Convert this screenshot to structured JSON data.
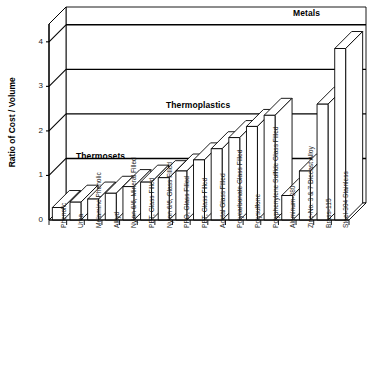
{
  "chart_data": {
    "type": "bar",
    "title": "",
    "xlabel": "",
    "ylabel": "Ratio of Cost / Volume",
    "ylim": [
      0,
      4.4
    ],
    "yticks": [
      0,
      1,
      2,
      3,
      4
    ],
    "ytick_labels": [
      "0",
      "1",
      "2",
      "3",
      "4"
    ],
    "grid": false,
    "style": "3d-bar",
    "legend_position": "none",
    "group_labels": [
      {
        "name": "thermosets",
        "text": "Thermosets"
      },
      {
        "name": "thermoplastics",
        "text": "Thermoplastics"
      },
      {
        "name": "metals",
        "text": "Metals"
      }
    ],
    "categories": [
      "Phenolic",
      "Urea",
      "Melamine Phenolic",
      "Alkyd",
      "Nylon 6/6, Mineral Filled",
      "PET, Glass Filled",
      "Nylon 6/6, Glass Filled",
      "PPO, Glass Filled",
      "PBT, Glass Filled",
      "Acetal Glass Filled",
      "Polycarbonate Glass Filled",
      "Polysulfone",
      "Polyphenylene Sulfide Glass Filled",
      "Aluminum-380",
      "Zinc-No. 3 & 7 Diecast Alloy",
      "Brass-115",
      "Steel-304 Stainless"
    ],
    "values": [
      0.28,
      0.4,
      0.47,
      0.6,
      0.75,
      0.85,
      0.95,
      1.1,
      1.35,
      1.6,
      1.85,
      2.1,
      2.35,
      0.55,
      1.1,
      2.6,
      3.85
    ],
    "groups": [
      {
        "name": "Thermosets",
        "start_index": 0,
        "end_index": 3
      },
      {
        "name": "Thermoplastics",
        "start_index": 4,
        "end_index": 12
      },
      {
        "name": "Metals",
        "start_index": 13,
        "end_index": 16
      }
    ]
  }
}
